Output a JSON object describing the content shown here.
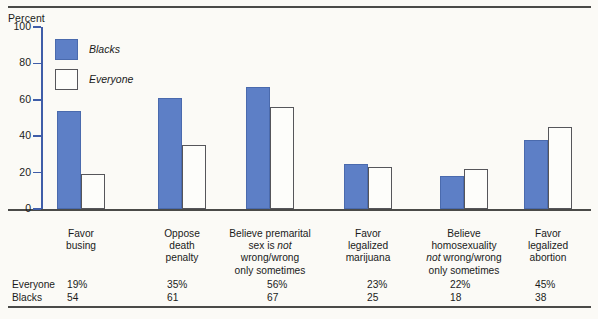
{
  "axis": {
    "title": "Percent",
    "ticks": [
      "100",
      "80",
      "60",
      "40",
      "20",
      "0"
    ]
  },
  "legend": {
    "items": [
      {
        "label": "Blacks",
        "style": "filled",
        "color": "#5d7fc6"
      },
      {
        "label": "Everyone",
        "style": "open",
        "color": "#fdfdfa"
      }
    ]
  },
  "categories": [
    {
      "lines": [
        "Favor",
        "busing"
      ]
    },
    {
      "lines": [
        "Oppose",
        "death",
        "penalty"
      ]
    },
    {
      "lines": [
        "Believe premarital",
        "sex is not",
        "wrong/wrong",
        "only sometimes"
      ]
    },
    {
      "lines": [
        "Favor",
        "legalized",
        "marijuana"
      ]
    },
    {
      "lines": [
        "Believe",
        "homosexuality",
        "not wrong/wrong",
        "only sometimes"
      ]
    },
    {
      "lines": [
        "Favor",
        "legalized",
        "abortion"
      ]
    }
  ],
  "table": {
    "row_labels": [
      "Everyone",
      "Blacks"
    ],
    "everyone": [
      "19%",
      "35%",
      "56%",
      "23%",
      "22%",
      "45%"
    ],
    "blacks": [
      "54",
      "61",
      "67",
      "25",
      "18",
      "38"
    ]
  },
  "chart_data": {
    "type": "bar",
    "title": "",
    "xlabel": "",
    "ylabel": "Percent",
    "ylim": [
      0,
      100
    ],
    "yticks": [
      0,
      20,
      40,
      60,
      80,
      100
    ],
    "grid": false,
    "legend_position": "upper-left-inside",
    "categories": [
      "Favor busing",
      "Oppose death penalty",
      "Believe premarital sex is not wrong/wrong only sometimes",
      "Favor legalized marijuana",
      "Believe homosexuality not wrong/wrong only sometimes",
      "Favor legalized abortion"
    ],
    "series": [
      {
        "name": "Blacks",
        "color": "#5d7fc6",
        "values": [
          54,
          61,
          67,
          25,
          18,
          38
        ]
      },
      {
        "name": "Everyone",
        "color": "#fdfdfa",
        "values": [
          19,
          35,
          56,
          23,
          22,
          45
        ]
      }
    ]
  }
}
